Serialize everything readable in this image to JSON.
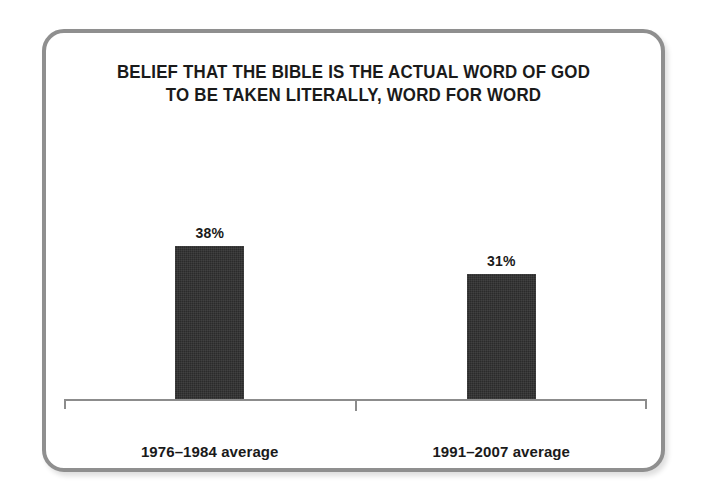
{
  "chart_data": {
    "type": "bar",
    "title": "BELIEF THAT THE BIBLE IS THE ACTUAL WORD OF GOD TO BE TAKEN LITERALLY, WORD FOR WORD",
    "title_lines": [
      "BELIEF THAT THE BIBLE IS THE ACTUAL WORD OF GOD",
      "TO BE TAKEN LITERALLY, WORD FOR WORD"
    ],
    "categories": [
      "1976–1984 average",
      "1991–2007 average"
    ],
    "values": [
      38,
      31
    ],
    "value_labels": [
      "38%",
      "31%"
    ],
    "xlabel": "",
    "ylabel": "",
    "ylim": [
      0,
      55
    ],
    "grid": false,
    "legend": null,
    "bar_color": "#2b2b2b",
    "axis_color": "#8c8c8c",
    "frame_color": "#8f8f8f",
    "background_color": "#ffffff",
    "text_color": "#1a1a1a"
  }
}
